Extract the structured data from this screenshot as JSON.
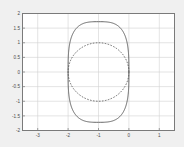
{
  "figure": {
    "background_color": "#f0f0f0",
    "plot_background_color": "#ffffff",
    "frame_color": "#7a7a7a",
    "grid_color": "#d2d2d2",
    "curve_color": "#4d4d4d"
  },
  "chart_data": {
    "type": "line",
    "title": "",
    "xlabel": "",
    "ylabel": "",
    "xlim": [
      -3.5,
      1.5
    ],
    "ylim": [
      -2,
      2
    ],
    "xticks": [
      -3,
      -2,
      -1,
      0,
      1
    ],
    "xticklabels": [
      "-3",
      "-2",
      "-1",
      "0",
      "1"
    ],
    "yticks": [
      -2,
      -1.5,
      -1,
      -0.5,
      0,
      0.5,
      1,
      1.5,
      2
    ],
    "yticklabels": [
      "-2",
      "-1.5",
      "-1",
      "-0.5",
      "0",
      "0.5",
      "1",
      "1.5",
      "2"
    ],
    "grid": true,
    "legend": null,
    "series": [
      {
        "name": "outer-superellipse",
        "style": "solid",
        "color": "#4d4d4d",
        "shape": "superellipse",
        "center": [
          -1,
          0
        ],
        "semi_x": 1.0,
        "semi_y": 1.72,
        "exponent": 3.2,
        "closed": true
      },
      {
        "name": "inner-circle",
        "style": "dashed",
        "color": "#4d4d4d",
        "shape": "ellipse",
        "center": [
          -1,
          0
        ],
        "semi_x": 1.0,
        "semi_y": 1.0,
        "closed": true
      }
    ]
  }
}
